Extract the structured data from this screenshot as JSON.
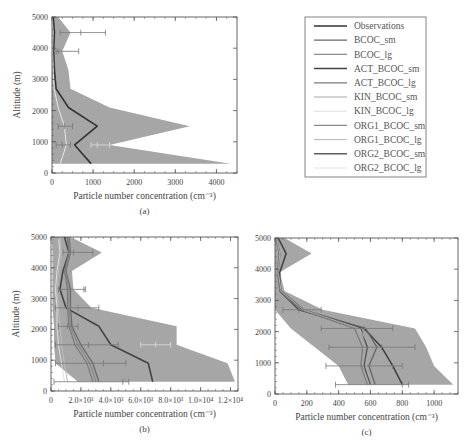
{
  "chart_data": [
    {
      "id": "a",
      "type": "line",
      "caption": "(a)",
      "xlabel": "Particle number concentration (cm⁻³)",
      "ylabel": "Altitude (m)",
      "xlim": [
        0,
        4500
      ],
      "ylim": [
        0,
        5000
      ],
      "xticks": [
        0,
        1000,
        2000,
        3000,
        4000
      ],
      "xtick_labels": [
        "0",
        "1000",
        "2000",
        "3000",
        "4000"
      ],
      "yticks": [
        0,
        1000,
        2000,
        3000,
        4000,
        5000
      ],
      "ytick_labels": [
        "0",
        "1000",
        "2000",
        "3000",
        "4000",
        "5000"
      ],
      "frame": {
        "x0": 52,
        "x1": 237,
        "y0": 173,
        "y1": 17
      },
      "shaded_range": {
        "altitudes": [
          300,
          900,
          1500,
          2100,
          2700,
          3300,
          3900,
          4500,
          5000
        ],
        "min": [
          0,
          0,
          0,
          0,
          0,
          0,
          0,
          0,
          0
        ],
        "max": [
          4350,
          1400,
          3350,
          1400,
          450,
          400,
          250,
          450,
          150
        ]
      },
      "series": [
        {
          "name": "Observations",
          "color": "#333333",
          "width": 1.6,
          "altitudes": [
            300,
            900,
            1500,
            2100,
            2700,
            3300,
            3900,
            4500,
            5000
          ],
          "values": [
            950,
            550,
            1100,
            400,
            100,
            60,
            40,
            60,
            30
          ]
        },
        {
          "name": "BCOC_sm",
          "color": "#a8a8a8",
          "width": 1,
          "altitudes": [
            300,
            900,
            1500,
            2100,
            2700,
            3300,
            3900,
            4500,
            5000
          ],
          "values": [
            120,
            280,
            260,
            120,
            40,
            20,
            10,
            15,
            5
          ]
        },
        {
          "name": "KIN_BCOC_lg",
          "color": "#e8e8e8",
          "width": 1,
          "altitudes": [
            300,
            900,
            1500,
            2100,
            2700,
            3300,
            3900,
            4500,
            5000
          ],
          "values": [
            200,
            350,
            300,
            150,
            50,
            25,
            15,
            20,
            8
          ]
        }
      ],
      "error_bars": [
        {
          "alt": 4500,
          "lo": 200,
          "hi": 1300,
          "center": 700
        },
        {
          "alt": 3900,
          "lo": 100,
          "hi": 650,
          "center": 150
        },
        {
          "alt": 900,
          "lo": 950,
          "hi": 1400,
          "center": 1100,
          "color": "#dddddd"
        },
        {
          "alt": 1500,
          "lo": 150,
          "hi": 500,
          "center": 300
        },
        {
          "alt": 900,
          "lo": 100,
          "hi": 450,
          "center": 250
        }
      ]
    },
    {
      "id": "b",
      "type": "line",
      "caption": "(b)",
      "xlabel": "Particle number concentration (cm⁻³)",
      "ylabel": "Altitude (m)",
      "xlim": [
        0,
        12500
      ],
      "ylim": [
        0,
        5000
      ],
      "xticks": [
        0,
        2000,
        4000,
        6000,
        8000,
        10000,
        12000
      ],
      "xtick_labels": [
        "0",
        "2.0×10³",
        "4.0×10³",
        "6.0×10³",
        "8.0×10³",
        "1.0×10⁴",
        "1.2×10⁴"
      ],
      "yticks": [
        0,
        1000,
        2000,
        3000,
        4000,
        5000
      ],
      "ytick_labels": [
        "0",
        "1000",
        "2000",
        "3000",
        "4000",
        "5000"
      ],
      "frame": {
        "x0": 51,
        "x1": 238,
        "y0": 391,
        "y1": 237
      },
      "shaded_range": {
        "altitudes": [
          300,
          900,
          1500,
          2100,
          2700,
          3300,
          3900,
          4500,
          5000
        ],
        "min": [
          1800,
          300,
          200,
          200,
          100,
          100,
          100,
          100,
          50
        ],
        "max": [
          12300,
          11800,
          8400,
          8400,
          2700,
          1500,
          1400,
          3400,
          1300
        ]
      },
      "series": [
        {
          "name": "Observations",
          "color": "#444444",
          "width": 1.6,
          "altitudes": [
            300,
            900,
            1500,
            2100,
            2700,
            3300,
            3900,
            4500,
            5000
          ],
          "values": [
            6800,
            6500,
            4000,
            3200,
            1000,
            600,
            800,
            1200,
            900
          ]
        },
        {
          "name": "BCOC_sm",
          "color": "#6e6e6e",
          "width": 1.4,
          "altitudes": [
            300,
            900,
            1500,
            2100,
            2700,
            3300,
            3900,
            4500,
            5000
          ],
          "values": [
            3200,
            2800,
            2000,
            1400,
            1300,
            1300,
            1000,
            1300,
            1200
          ]
        },
        {
          "name": "ACT_BCOC_lg",
          "color": "#8a8a8a",
          "width": 1.4,
          "altitudes": [
            300,
            900,
            1500,
            2100,
            2700,
            3300,
            3900,
            4500,
            5000
          ],
          "values": [
            3000,
            2600,
            1800,
            1300,
            1200,
            1200,
            950,
            1250,
            1150
          ]
        },
        {
          "name": "ORG1_BCOC_sm",
          "color": "#7a7a7a",
          "width": 1.2,
          "altitudes": [
            300,
            900,
            1500,
            2100,
            2700,
            3300,
            3900,
            4500,
            5000
          ],
          "values": [
            2800,
            2400,
            1600,
            1200,
            1100,
            1100,
            900,
            1200,
            1100
          ]
        },
        {
          "name": "KIN_BCOC_sm",
          "color": "#bdbdbd",
          "width": 1,
          "altitudes": [
            300,
            900,
            1500,
            2100,
            2700,
            3300,
            3900,
            4500,
            5000
          ],
          "values": [
            1100,
            900,
            700,
            600,
            500,
            400,
            500,
            700,
            600
          ]
        },
        {
          "name": "ORG2_BCOC_lg",
          "color": "#e0e0e0",
          "width": 1,
          "altitudes": [
            300,
            900,
            1500,
            2100,
            2700,
            3300,
            3900,
            4500,
            5000
          ],
          "values": [
            900,
            700,
            500,
            400,
            400,
            300,
            400,
            600,
            500
          ]
        }
      ],
      "error_bars": [
        {
          "alt": 4500,
          "lo": 800,
          "hi": 2800,
          "center": 1500
        },
        {
          "alt": 3300,
          "lo": 500,
          "hi": 2300,
          "center": 2200
        },
        {
          "alt": 2700,
          "lo": 300,
          "hi": 3200,
          "center": 1800
        },
        {
          "alt": 2100,
          "lo": 500,
          "hi": 1800,
          "center": 1100
        },
        {
          "alt": 1500,
          "lo": 300,
          "hi": 4500,
          "center": 2500
        },
        {
          "alt": 1500,
          "lo": 6000,
          "hi": 8000,
          "center": 7000,
          "color": "#dddddd"
        },
        {
          "alt": 900,
          "lo": 300,
          "hi": 5000,
          "center": 3500
        },
        {
          "alt": 300,
          "lo": 200,
          "hi": 5200,
          "center": 4800
        }
      ]
    },
    {
      "id": "c",
      "type": "line",
      "caption": "(c)",
      "xlabel": "Particle number concentration (cm⁻³)",
      "ylabel": "",
      "xlim": [
        0,
        1150
      ],
      "ylim": [
        0,
        5000
      ],
      "xticks": [
        0,
        200,
        400,
        600,
        800,
        1000
      ],
      "xtick_labels": [
        "0",
        "200",
        "400",
        "600",
        "800",
        "1000"
      ],
      "yticks": [
        0,
        1000,
        2000,
        3000,
        4000,
        5000
      ],
      "ytick_labels": [
        "0",
        "1000",
        "2000",
        "3000",
        "4000",
        "5000"
      ],
      "frame": {
        "x0": 275,
        "x1": 458,
        "y0": 394,
        "y1": 238
      },
      "shaded_range": {
        "altitudes": [
          300,
          900,
          1500,
          2100,
          2700,
          3300,
          3900,
          4500,
          5000
        ],
        "min": [
          460,
          400,
          250,
          100,
          0,
          0,
          0,
          0,
          0
        ],
        "max": [
          1120,
          1000,
          950,
          880,
          300,
          60,
          30,
          230,
          60
        ]
      },
      "series": [
        {
          "name": "Observations",
          "color": "#444444",
          "width": 1.6,
          "altitudes": [
            300,
            900,
            1500,
            2100,
            2700,
            3300,
            3900,
            4500,
            5000
          ],
          "values": [
            800,
            740,
            670,
            560,
            150,
            30,
            30,
            70,
            20
          ]
        },
        {
          "name": "BCOC_sm",
          "color": "#666666",
          "width": 1.3,
          "altitudes": [
            300,
            900,
            1500,
            2100,
            2700,
            3300,
            3900,
            4500,
            5000
          ],
          "values": [
            630,
            590,
            640,
            570,
            180,
            40,
            20,
            30,
            10
          ]
        },
        {
          "name": "ACT_BCOC_sm",
          "color": "#555555",
          "width": 1.3,
          "altitudes": [
            300,
            900,
            1500,
            2100,
            2700,
            3300,
            3900,
            4500,
            5000
          ],
          "values": [
            600,
            560,
            580,
            540,
            170,
            35,
            18,
            28,
            10
          ]
        },
        {
          "name": "ORG1_BCOC_sm",
          "color": "#7a7a7a",
          "width": 1.2,
          "altitudes": [
            300,
            900,
            1500,
            2100,
            2700,
            3300,
            3900,
            4500,
            5000
          ],
          "values": [
            580,
            540,
            550,
            500,
            160,
            30,
            15,
            25,
            8
          ]
        },
        {
          "name": "KIN_BCOC_sm",
          "color": "#b0b0b0",
          "width": 1,
          "altitudes": [
            300,
            900,
            1500,
            2100,
            2700,
            3300,
            3900,
            4500,
            5000
          ],
          "values": [
            610,
            570,
            600,
            530,
            175,
            38,
            20,
            30,
            10
          ]
        }
      ],
      "error_bars": [
        {
          "alt": 2700,
          "lo": 50,
          "hi": 290,
          "center": 150
        },
        {
          "alt": 2100,
          "lo": 290,
          "hi": 740,
          "center": 560
        },
        {
          "alt": 1500,
          "lo": 340,
          "hi": 880,
          "center": 670
        },
        {
          "alt": 900,
          "lo": 320,
          "hi": 800,
          "center": 740
        },
        {
          "alt": 300,
          "lo": 380,
          "hi": 840,
          "center": 800
        }
      ]
    }
  ],
  "legend": {
    "box": {
      "x": 305,
      "y": 17,
      "w": 121,
      "h": 160
    },
    "items": [
      {
        "label": "Observations",
        "color": "#333333",
        "width": 1.6
      },
      {
        "label": "BCOC_sm",
        "color": "#666666",
        "width": 1.3
      },
      {
        "label": "BCOC_lg",
        "color": "#8c8c8c",
        "width": 1.1
      },
      {
        "label": "ACT_BCOC_sm",
        "color": "#444444",
        "width": 1.5
      },
      {
        "label": "ACT_BCOC_lg",
        "color": "#7a7a7a",
        "width": 1.3
      },
      {
        "label": "KIN_BCOC_sm",
        "color": "#a8a8a8",
        "width": 1.1
      },
      {
        "label": "KIN_BCOC_lg",
        "color": "#dddddd",
        "width": 1
      },
      {
        "label": "ORG1_BCOC_sm",
        "color": "#8a8a8a",
        "width": 1.2
      },
      {
        "label": "ORG1_BCOC_lg",
        "color": "#b8b8b8",
        "width": 1
      },
      {
        "label": "ORG2_BCOC_sm",
        "color": "#5e5e5e",
        "width": 1.4
      },
      {
        "label": "ORG2_BCOC_lg",
        "color": "#e4e4e4",
        "width": 1
      }
    ]
  },
  "colors": {
    "shade": "#a6a6a6",
    "frame": "#555555",
    "errorbar": "#777777"
  }
}
